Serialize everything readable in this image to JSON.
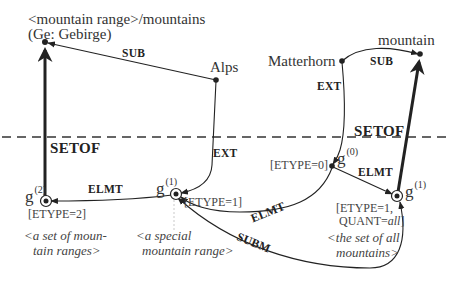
{
  "nodes": {
    "mountain_range": {
      "label_line1": "<mountain range>/mountains",
      "label_line2": "(Ge: Gebirge)"
    },
    "alps": {
      "label": "Alps"
    },
    "matterhorn": {
      "label": "Matterhorn"
    },
    "mountain": {
      "label": "mountain"
    },
    "g2": {
      "g": "g",
      "sup": "(2)",
      "attr": "[ETYPE=2]",
      "gloss_line1": "<a set of  moun-",
      "gloss_line2": "tain  ranges>"
    },
    "g1_mid": {
      "g": "g",
      "sup": "(1)",
      "attr": "[ETYPE=1]",
      "gloss_line1": "<a special",
      "gloss_line2": "mountain range>"
    },
    "g0": {
      "g": "g",
      "sup": "(0)",
      "attr": "[ETYPE=0]"
    },
    "g1_right": {
      "g": "g",
      "sup": "(1)",
      "attr_line1": "[ETYPE=1,",
      "attr_line2_prefix": "QUANT=",
      "attr_line2_italic": "all",
      "attr_line2_suffix": "]",
      "gloss_line1": "<the set of all",
      "gloss_line2": "mountains>"
    }
  },
  "edges": {
    "sub_left": "SUB",
    "sub_right": "SUB",
    "ext_left": "EXT",
    "ext_right": "EXT",
    "setof_left": "SETOF",
    "setof_right": "SETOF",
    "elmt_left": "ELMT",
    "elmt_mid": "ELMT",
    "elmt_right": "ELMT",
    "subm": "SUBM"
  },
  "colors": {
    "ink": "#222222",
    "background": "#ffffff"
  }
}
